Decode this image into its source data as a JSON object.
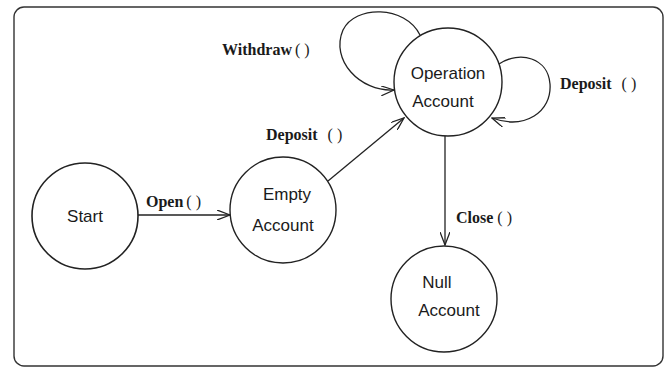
{
  "diagram": {
    "type": "state-machine",
    "colors": {
      "stroke": "#222222",
      "background": "#ffffff"
    },
    "states": [
      {
        "id": "start",
        "lines": [
          "Start"
        ]
      },
      {
        "id": "empty",
        "lines": [
          "Empty",
          "Account"
        ]
      },
      {
        "id": "operation",
        "lines": [
          "Operation",
          "Account"
        ]
      },
      {
        "id": "null",
        "lines": [
          "Null",
          "Account"
        ]
      }
    ],
    "transitions": [
      {
        "from": "start",
        "to": "empty",
        "name": "Open",
        "parens": "( )"
      },
      {
        "from": "empty",
        "to": "operation",
        "name": "Deposit",
        "parens": "( )"
      },
      {
        "from": "operation",
        "to": "operation",
        "name": "Withdraw",
        "parens": "( )"
      },
      {
        "from": "operation",
        "to": "operation",
        "name": "Deposit",
        "parens": "( )",
        "side": "right"
      },
      {
        "from": "operation",
        "to": "null",
        "name": "Close",
        "parens": "( )"
      }
    ]
  }
}
